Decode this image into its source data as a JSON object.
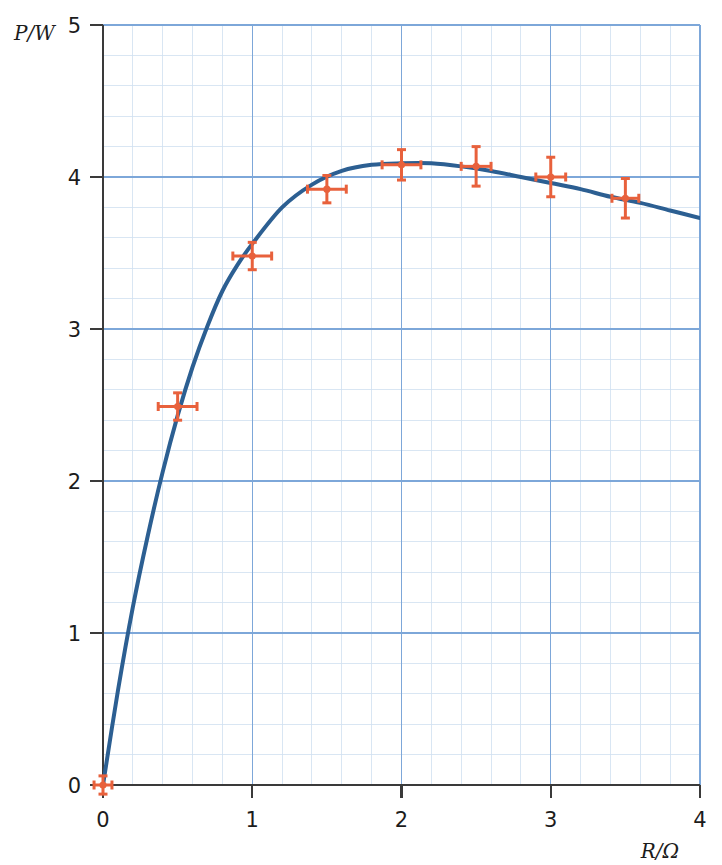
{
  "chart_data": {
    "type": "line",
    "title": "",
    "xlabel": "R/Ω",
    "ylabel": "P/W",
    "xlim": [
      0,
      4
    ],
    "ylim": [
      0,
      5
    ],
    "xticks": [
      "0",
      "1",
      "2",
      "3",
      "4"
    ],
    "xtick_values": [
      0,
      1,
      2,
      3,
      4
    ],
    "yticks": [
      "0",
      "1",
      "2",
      "3",
      "4",
      "5"
    ],
    "ytick_values": [
      0,
      1,
      2,
      3,
      4,
      5
    ],
    "grid": "graph-paper, minor lines every 0.2 units, major blue lines every 1 unit",
    "legend": "none",
    "series": [
      {
        "name": "fitted curve",
        "type": "line",
        "color": "#2c5f92",
        "x": [
          0,
          0.1,
          0.2,
          0.3,
          0.4,
          0.5,
          0.6,
          0.7,
          0.8,
          0.9,
          1.0,
          1.2,
          1.4,
          1.6,
          1.8,
          2.0,
          2.2,
          2.4,
          2.6,
          2.8,
          3.0,
          3.2,
          3.4,
          3.6,
          3.8,
          4.0
        ],
        "y": [
          0.0,
          0.62,
          1.17,
          1.64,
          2.06,
          2.43,
          2.75,
          3.02,
          3.25,
          3.42,
          3.56,
          3.8,
          3.95,
          4.04,
          4.08,
          4.09,
          4.09,
          4.07,
          4.04,
          4.0,
          3.96,
          3.92,
          3.87,
          3.83,
          3.78,
          3.73
        ]
      },
      {
        "name": "measurements",
        "type": "scatter-errorbar",
        "color": "#e8613c",
        "points": [
          {
            "x": 0.0,
            "y": 0.0,
            "xerr": 0.06,
            "yerr": 0.06
          },
          {
            "x": 0.5,
            "y": 2.49,
            "xerr": 0.13,
            "yerr": 0.09
          },
          {
            "x": 1.0,
            "y": 3.48,
            "xerr": 0.13,
            "yerr": 0.09
          },
          {
            "x": 1.5,
            "y": 3.92,
            "xerr": 0.13,
            "yerr": 0.09
          },
          {
            "x": 2.0,
            "y": 4.08,
            "xerr": 0.13,
            "yerr": 0.1
          },
          {
            "x": 2.5,
            "y": 4.07,
            "xerr": 0.1,
            "yerr": 0.13
          },
          {
            "x": 3.0,
            "y": 4.0,
            "xerr": 0.1,
            "yerr": 0.13
          },
          {
            "x": 3.5,
            "y": 3.86,
            "xerr": 0.09,
            "yerr": 0.13
          }
        ]
      }
    ],
    "colors": {
      "curve": "#2c5f92",
      "markers": "#e8613c",
      "axis": "#3a3a3a",
      "grid_major": "#7da7d9",
      "grid_minor": "#cfe0f0",
      "background": "#ffffff"
    }
  }
}
